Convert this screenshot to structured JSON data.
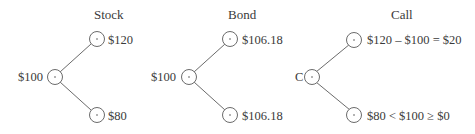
{
  "trees": [
    {
      "title": "Stock",
      "root_label": "$100",
      "up_label": "$120",
      "down_label": "$80"
    },
    {
      "title": "Bond",
      "root_label": "$100",
      "up_label": "$106.18",
      "down_label": "$106.18"
    },
    {
      "title": "Call",
      "root_label": "C",
      "up_label": "$120 – $100 = $20",
      "down_label": "$80 < $100 ≥ $0"
    }
  ],
  "colors": {
    "line": "#6b6b6b",
    "text": "#3a3a3a"
  }
}
